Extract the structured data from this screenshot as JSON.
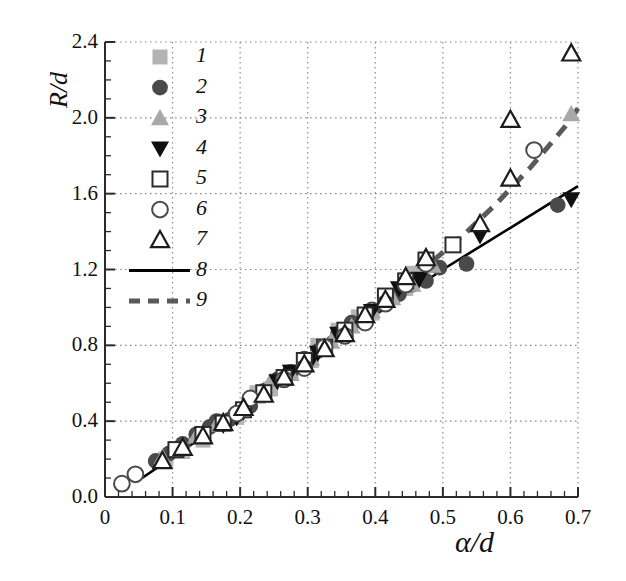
{
  "chart_data": {
    "type": "scatter",
    "title": "",
    "xlabel": "α/d",
    "ylabel": "R/d",
    "xlim": [
      0,
      0.7
    ],
    "ylim": [
      0.0,
      2.4
    ],
    "grid": true,
    "legend_position": "upper-left",
    "xticks": [
      "0",
      "0.1",
      "0.2",
      "0.3",
      "0.4",
      "0.5",
      "0.6",
      "0.7"
    ],
    "xtick_values": [
      0,
      0.1,
      0.2,
      0.3,
      0.4,
      0.5,
      0.6,
      0.7
    ],
    "yticks": [
      "0.0",
      "0.4",
      "0.8",
      "1.2",
      "1.6",
      "2.0",
      "2.4"
    ],
    "ytick_values": [
      0.0,
      0.4,
      0.8,
      1.2,
      1.6,
      2.0,
      2.4
    ],
    "x_minor_step": 0.02,
    "y_minor_step": 0.1,
    "legend": [
      {
        "key": "1",
        "marker": "square-filled",
        "color": "#b4b4b4"
      },
      {
        "key": "2",
        "marker": "circle-filled",
        "color": "#4a4a4a"
      },
      {
        "key": "3",
        "marker": "triangle-up-filled",
        "color": "#a8a8a8"
      },
      {
        "key": "4",
        "marker": "triangle-down-filled",
        "color": "#101010"
      },
      {
        "key": "5",
        "marker": "square-open",
        "color": "#2b2b2b"
      },
      {
        "key": "6",
        "marker": "circle-open",
        "color": "#4a4a4a"
      },
      {
        "key": "7",
        "marker": "triangle-up-open",
        "color": "#1c1c1c"
      },
      {
        "key": "8",
        "marker": "line-solid",
        "color": "#000000"
      },
      {
        "key": "9",
        "marker": "line-dashed",
        "color": "#5a5a5a"
      }
    ],
    "series": [
      {
        "name": "1",
        "marker": "square-filled",
        "color": "#b4b4b4",
        "points": [
          [
            0.09,
            0.2
          ],
          [
            0.115,
            0.24
          ],
          [
            0.145,
            0.3
          ],
          [
            0.175,
            0.4
          ],
          [
            0.195,
            0.42
          ],
          [
            0.205,
            0.46
          ],
          [
            0.225,
            0.55
          ],
          [
            0.245,
            0.57
          ],
          [
            0.275,
            0.66
          ],
          [
            0.305,
            0.72
          ],
          [
            0.315,
            0.8
          ],
          [
            0.345,
            0.88
          ],
          [
            0.375,
            0.95
          ],
          [
            0.395,
            0.97
          ],
          [
            0.425,
            1.05
          ],
          [
            0.445,
            1.1
          ],
          [
            0.455,
            1.18
          ],
          [
            0.475,
            1.22
          ]
        ]
      },
      {
        "name": "2",
        "marker": "circle-filled",
        "color": "#4a4a4a",
        "points": [
          [
            0.075,
            0.19
          ],
          [
            0.095,
            0.23
          ],
          [
            0.115,
            0.28
          ],
          [
            0.135,
            0.33
          ],
          [
            0.155,
            0.37
          ],
          [
            0.165,
            0.4
          ],
          [
            0.185,
            0.41
          ],
          [
            0.215,
            0.48
          ],
          [
            0.235,
            0.56
          ],
          [
            0.255,
            0.62
          ],
          [
            0.275,
            0.66
          ],
          [
            0.295,
            0.73
          ],
          [
            0.315,
            0.77
          ],
          [
            0.345,
            0.86
          ],
          [
            0.365,
            0.92
          ],
          [
            0.395,
            0.99
          ],
          [
            0.415,
            1.05
          ],
          [
            0.435,
            1.07
          ],
          [
            0.455,
            1.12
          ],
          [
            0.475,
            1.14
          ],
          [
            0.495,
            1.21
          ],
          [
            0.535,
            1.23
          ],
          [
            0.67,
            1.54
          ]
        ]
      },
      {
        "name": "3",
        "marker": "triangle-up-filled",
        "color": "#a8a8a8",
        "points": [
          [
            0.085,
            0.21
          ],
          [
            0.135,
            0.32
          ],
          [
            0.165,
            0.38
          ],
          [
            0.195,
            0.45
          ],
          [
            0.225,
            0.53
          ],
          [
            0.245,
            0.61
          ],
          [
            0.275,
            0.65
          ],
          [
            0.305,
            0.73
          ],
          [
            0.335,
            0.82
          ],
          [
            0.365,
            0.9
          ],
          [
            0.395,
            0.98
          ],
          [
            0.425,
            1.05
          ],
          [
            0.455,
            1.12
          ],
          [
            0.485,
            1.22
          ],
          [
            0.69,
            2.02
          ]
        ]
      },
      {
        "name": "4",
        "marker": "triangle-down-filled",
        "color": "#101010",
        "points": [
          [
            0.145,
            0.33
          ],
          [
            0.175,
            0.38
          ],
          [
            0.195,
            0.42
          ],
          [
            0.205,
            0.45
          ],
          [
            0.255,
            0.61
          ],
          [
            0.275,
            0.66
          ],
          [
            0.305,
            0.72
          ],
          [
            0.315,
            0.76
          ],
          [
            0.345,
            0.86
          ],
          [
            0.395,
            0.98
          ],
          [
            0.435,
            1.1
          ],
          [
            0.465,
            1.15
          ],
          [
            0.555,
            1.38
          ],
          [
            0.69,
            1.57
          ]
        ]
      },
      {
        "name": "5",
        "marker": "square-open",
        "color": "#2b2b2b",
        "points": [
          [
            0.105,
            0.25
          ],
          [
            0.145,
            0.33
          ],
          [
            0.175,
            0.39
          ],
          [
            0.205,
            0.46
          ],
          [
            0.235,
            0.55
          ],
          [
            0.265,
            0.63
          ],
          [
            0.295,
            0.72
          ],
          [
            0.325,
            0.79
          ],
          [
            0.355,
            0.88
          ],
          [
            0.385,
            0.96
          ],
          [
            0.415,
            1.06
          ],
          [
            0.445,
            1.14
          ],
          [
            0.475,
            1.25
          ],
          [
            0.515,
            1.33
          ]
        ]
      },
      {
        "name": "6",
        "marker": "circle-open",
        "color": "#4a4a4a",
        "points": [
          [
            0.025,
            0.07
          ],
          [
            0.045,
            0.12
          ],
          [
            0.195,
            0.44
          ],
          [
            0.215,
            0.52
          ],
          [
            0.265,
            0.62
          ],
          [
            0.295,
            0.68
          ],
          [
            0.325,
            0.79
          ],
          [
            0.355,
            0.85
          ],
          [
            0.385,
            0.92
          ],
          [
            0.415,
            1.02
          ],
          [
            0.445,
            1.12
          ],
          [
            0.475,
            1.23
          ],
          [
            0.635,
            1.83
          ]
        ]
      },
      {
        "name": "7",
        "marker": "triangle-up-open",
        "color": "#1c1c1c",
        "points": [
          [
            0.085,
            0.19
          ],
          [
            0.115,
            0.26
          ],
          [
            0.145,
            0.32
          ],
          [
            0.175,
            0.39
          ],
          [
            0.205,
            0.47
          ],
          [
            0.235,
            0.54
          ],
          [
            0.265,
            0.63
          ],
          [
            0.295,
            0.7
          ],
          [
            0.325,
            0.78
          ],
          [
            0.355,
            0.86
          ],
          [
            0.385,
            0.96
          ],
          [
            0.415,
            1.04
          ],
          [
            0.445,
            1.16
          ],
          [
            0.475,
            1.26
          ],
          [
            0.555,
            1.44
          ],
          [
            0.6,
            1.68
          ],
          [
            0.6,
            1.99
          ],
          [
            0.69,
            2.34
          ]
        ]
      }
    ],
    "curves": [
      {
        "name": "8",
        "style": "solid",
        "color": "#000000",
        "width": 2.6,
        "points": [
          [
            0.055,
            0.1
          ],
          [
            0.1,
            0.21
          ],
          [
            0.15,
            0.33
          ],
          [
            0.2,
            0.45
          ],
          [
            0.25,
            0.58
          ],
          [
            0.3,
            0.71
          ],
          [
            0.35,
            0.84
          ],
          [
            0.4,
            0.96
          ],
          [
            0.45,
            1.08
          ],
          [
            0.5,
            1.2
          ],
          [
            0.55,
            1.31
          ],
          [
            0.6,
            1.42
          ],
          [
            0.65,
            1.53
          ],
          [
            0.7,
            1.64
          ]
        ]
      },
      {
        "name": "9",
        "style": "dashed",
        "color": "#5a5a5a",
        "width": 5,
        "points": [
          [
            0.33,
            0.83
          ],
          [
            0.38,
            0.96
          ],
          [
            0.43,
            1.09
          ],
          [
            0.48,
            1.23
          ],
          [
            0.53,
            1.38
          ],
          [
            0.58,
            1.55
          ],
          [
            0.63,
            1.74
          ],
          [
            0.68,
            1.95
          ],
          [
            0.7,
            2.05
          ]
        ]
      }
    ]
  },
  "plot_geometry": {
    "left": 105,
    "right": 578,
    "top": 42,
    "bottom": 497
  }
}
